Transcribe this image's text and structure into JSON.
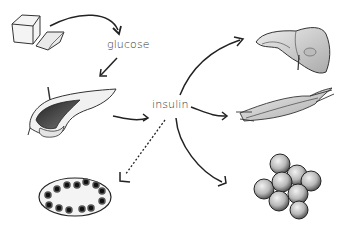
{
  "diagram": {
    "type": "biological process flow",
    "nodes": [
      {
        "id": "bread",
        "label": "",
        "icon": "bread-icon"
      },
      {
        "id": "glucose",
        "label": "glucose"
      },
      {
        "id": "pancreas",
        "label": "",
        "icon": "pancreas-icon"
      },
      {
        "id": "insulin",
        "label": "insulin"
      },
      {
        "id": "liver",
        "label": "",
        "icon": "liver-icon"
      },
      {
        "id": "muscle",
        "label": "",
        "icon": "muscle-icon"
      },
      {
        "id": "fat",
        "label": "",
        "icon": "fat-cells-icon"
      },
      {
        "id": "islet",
        "label": "",
        "icon": "islet-cell-icon"
      }
    ],
    "edges": [
      {
        "from": "bread",
        "to": "glucose",
        "style": "solid"
      },
      {
        "from": "glucose",
        "to": "pancreas",
        "style": "solid"
      },
      {
        "from": "pancreas",
        "to": "insulin",
        "style": "solid"
      },
      {
        "from": "insulin",
        "to": "liver",
        "style": "solid"
      },
      {
        "from": "insulin",
        "to": "muscle",
        "style": "solid"
      },
      {
        "from": "insulin",
        "to": "fat",
        "style": "solid"
      },
      {
        "from": "insulin",
        "to": "islet",
        "style": "dashed"
      }
    ]
  },
  "labels": {
    "glucose": "glucose",
    "insulin": "insulin"
  }
}
